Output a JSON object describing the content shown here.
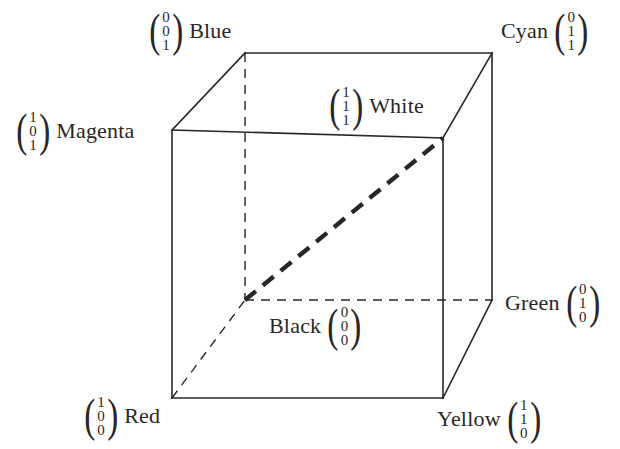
{
  "figure": {
    "title_alt": "RGB colour cube with vertex colour name labels and column vectors",
    "background": "#ffffff",
    "line_color": "#2a2628",
    "vertices": [
      {
        "id": "blue",
        "name": "Blue",
        "vector": [
          "0",
          "0",
          "1"
        ],
        "vector_side": "left",
        "x": 245,
        "y": 53,
        "label_x": 147,
        "label_y": 8,
        "hidden": false
      },
      {
        "id": "cyan",
        "name": "Cyan",
        "vector": [
          "0",
          "1",
          "1"
        ],
        "vector_side": "right",
        "x": 492,
        "y": 53,
        "label_x": 497,
        "label_y": 8,
        "hidden": false
      },
      {
        "id": "magenta",
        "name": "Magenta",
        "vector": [
          "1",
          "0",
          "1"
        ],
        "vector_side": "left",
        "x": 172,
        "y": 130,
        "label_x": 14,
        "label_y": 108,
        "hidden": false
      },
      {
        "id": "white",
        "name": "White",
        "vector": [
          "1",
          "1",
          "1"
        ],
        "vector_side": "left",
        "x": 443,
        "y": 138,
        "label_x": 327,
        "label_y": 83,
        "hidden": false
      },
      {
        "id": "black",
        "name": "Black",
        "vector": [
          "0",
          "0",
          "0"
        ],
        "vector_side": "right",
        "x": 245,
        "y": 300,
        "label_x": 265,
        "label_y": 303,
        "hidden": true
      },
      {
        "id": "green",
        "name": "Green",
        "vector": [
          "0",
          "1",
          "0"
        ],
        "vector_side": "right",
        "x": 492,
        "y": 300,
        "label_x": 501,
        "label_y": 280,
        "hidden": false
      },
      {
        "id": "red",
        "name": "Red",
        "vector": [
          "1",
          "0",
          "0"
        ],
        "vector_side": "left",
        "x": 172,
        "y": 398,
        "label_x": 82,
        "label_y": 393,
        "hidden": false
      },
      {
        "id": "yellow",
        "name": "Yellow",
        "vector": [
          "1",
          "1",
          "0"
        ],
        "vector_side": "right",
        "x": 443,
        "y": 398,
        "label_x": 433,
        "label_y": 396,
        "hidden": false
      }
    ],
    "edges": {
      "solid": [
        {
          "id": "front-top",
          "from": "magenta",
          "to": "white"
        },
        {
          "id": "front-left",
          "from": "magenta",
          "to": "red"
        },
        {
          "id": "front-bottom",
          "from": "red",
          "to": "yellow"
        },
        {
          "id": "front-right",
          "from": "white",
          "to": "yellow"
        },
        {
          "id": "back-top",
          "from": "blue",
          "to": "cyan"
        },
        {
          "id": "top-left",
          "from": "magenta",
          "to": "blue"
        },
        {
          "id": "top-right",
          "from": "white",
          "to": "cyan"
        },
        {
          "id": "right-back",
          "from": "cyan",
          "to": "green"
        },
        {
          "id": "bottom-right",
          "from": "yellow",
          "to": "green"
        }
      ],
      "dashed": [
        {
          "id": "hidden-vertical",
          "from": "blue",
          "to": "black"
        },
        {
          "id": "hidden-bottom",
          "from": "black",
          "to": "green"
        },
        {
          "id": "hidden-left",
          "from": "red",
          "to": "black"
        }
      ],
      "diagonal": {
        "id": "grey-axis-diagonal",
        "from": "black",
        "to": "white",
        "style": "thick-dashed"
      }
    }
  }
}
